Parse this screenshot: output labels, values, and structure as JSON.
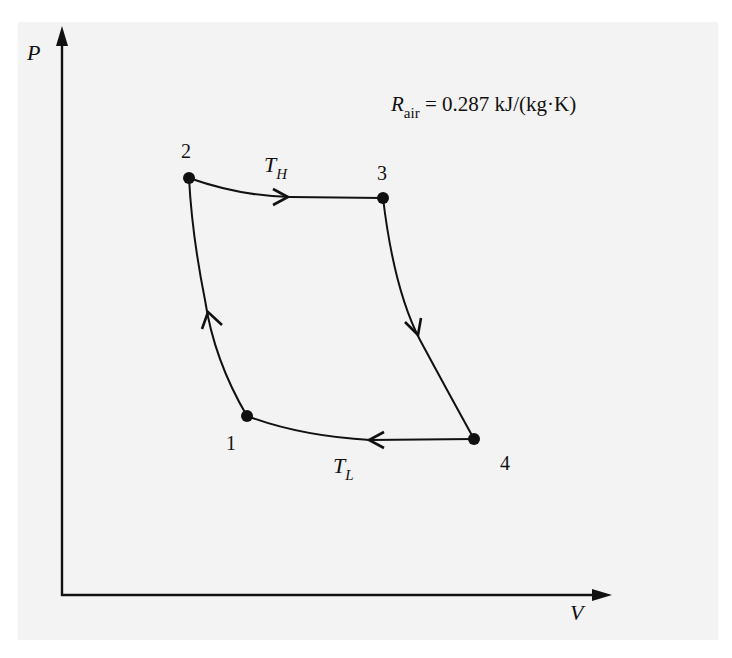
{
  "diagram": {
    "type": "P-V diagram (Carnot cycle)",
    "axes": {
      "y_label": "P",
      "x_label": "V"
    },
    "annotation": {
      "symbol": "R",
      "subscript": "air",
      "equals": "= 0.287 kJ/(kg·K)"
    },
    "points": [
      {
        "id": "1",
        "label": "1"
      },
      {
        "id": "2",
        "label": "2"
      },
      {
        "id": "3",
        "label": "3"
      },
      {
        "id": "4",
        "label": "4"
      }
    ],
    "processes": [
      {
        "from": "1",
        "to": "2",
        "type": "isentropic compression",
        "arrow": "up"
      },
      {
        "from": "2",
        "to": "3",
        "type": "isothermal expansion",
        "label": "T",
        "label_sub": "H",
        "arrow": "right"
      },
      {
        "from": "3",
        "to": "4",
        "type": "isentropic expansion",
        "arrow": "down"
      },
      {
        "from": "4",
        "to": "1",
        "type": "isothermal compression",
        "label": "T",
        "label_sub": "L",
        "arrow": "left"
      }
    ],
    "colors": {
      "ink": "#111111",
      "background": "#f3f3f3"
    }
  }
}
